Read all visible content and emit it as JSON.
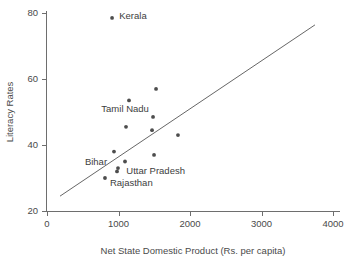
{
  "chart_data": {
    "type": "scatter",
    "title": "",
    "xlabel": "Net State Domestic Product (Rs. per capita)",
    "ylabel": "Literacy Rates",
    "xlim": [
      0,
      4000
    ],
    "ylim": [
      20,
      80
    ],
    "xticks": [
      0,
      1000,
      2000,
      3000,
      4000
    ],
    "yticks": [
      20,
      40,
      60,
      80
    ],
    "xtick_labels": [
      "0",
      "1000",
      "2000",
      "3000",
      "4000"
    ],
    "ytick_labels": [
      "20",
      "40",
      "60",
      "80"
    ],
    "grid": false,
    "legend": null,
    "marker_color": "#4d4d4d",
    "line_color": "#555555",
    "axis_color": "#6e6e6e",
    "points": [
      {
        "x": 910,
        "y": 78.5,
        "label": "Kerala"
      },
      {
        "x": 1525,
        "y": 57.0,
        "label": ""
      },
      {
        "x": 1147,
        "y": 53.5,
        "label": "Tamil Nadu"
      },
      {
        "x": 1483,
        "y": 48.5,
        "label": ""
      },
      {
        "x": 1105,
        "y": 45.5,
        "label": ""
      },
      {
        "x": 1469,
        "y": 44.5,
        "label": ""
      },
      {
        "x": 1832,
        "y": 43.0,
        "label": ""
      },
      {
        "x": 937,
        "y": 38.0,
        "label": ""
      },
      {
        "x": 1497,
        "y": 37.0,
        "label": ""
      },
      {
        "x": 1091,
        "y": 35.0,
        "label": ""
      },
      {
        "x": 993,
        "y": 33.0,
        "label": "Uttar Pradesh"
      },
      {
        "x": 979,
        "y": 32.0,
        "label": "Bihar"
      },
      {
        "x": 811,
        "y": 30.0,
        "label": "Rajasthan"
      }
    ],
    "fit_line": {
      "x1": 182,
      "y1": 24.5,
      "x2": 3748,
      "y2": 76.4
    },
    "annotations": [
      {
        "text": "Kerala",
        "x": 1010,
        "y": 78.3,
        "anchor": "start"
      },
      {
        "text": "Tamil Nadu",
        "x": 760,
        "y": 50.0,
        "anchor": "start"
      },
      {
        "text": "Bihar",
        "x": 530,
        "y": 34.0,
        "anchor": "start"
      },
      {
        "text": "Uttar Pradesh",
        "x": 1110,
        "y": 31.3,
        "anchor": "start"
      },
      {
        "text": "Rajasthan",
        "x": 880,
        "y": 27.5,
        "anchor": "start"
      }
    ]
  }
}
